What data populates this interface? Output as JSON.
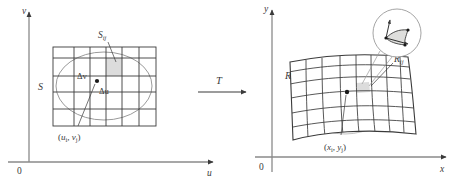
{
  "figure": {
    "type": "math-diagram",
    "background_color": "#ffffff",
    "line_color": "#3a3a3a",
    "shade_color": "#d9d9d9"
  },
  "left_panel": {
    "name": "uv-plane",
    "axis_v_label": "v",
    "axis_u_label": "u",
    "origin_label": "0",
    "region_label": "S",
    "subrect_label": "S",
    "subrect_sub": "ij",
    "delta_v_label": "Δv",
    "delta_u_label": "Δu",
    "point_label_open": "(",
    "point_label": "u",
    "point_sub_1": "i",
    "point_comma": ", ",
    "point_label_2": "v",
    "point_sub_2": "j",
    "point_label_close": ")",
    "grid_cols": 5,
    "grid_rows": 5
  },
  "transform": {
    "label": "T",
    "arrow": "right-arrow"
  },
  "right_panel": {
    "name": "xy-plane",
    "axis_y_label": "y",
    "axis_x_label": "x",
    "origin_label": "0",
    "region_label": "R",
    "subpatch_label": "R",
    "subpatch_sub": "ij",
    "point_label_open": "(",
    "point_label": "x",
    "point_sub_1": "i",
    "point_comma": ", ",
    "point_label_2": "y",
    "point_sub_2": "j",
    "point_label_close": ")",
    "magnifier": "circle-inset-detail",
    "grid_cols": 8,
    "grid_rows": 6
  }
}
